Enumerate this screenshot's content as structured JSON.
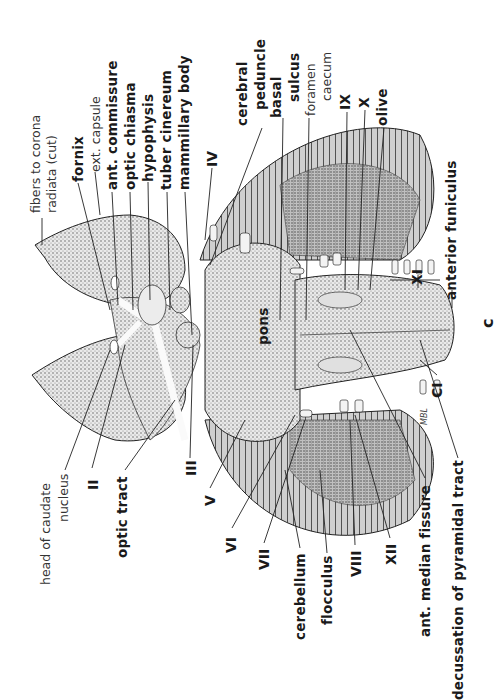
{
  "figure": {
    "panel_letter": "c",
    "signature": "MBL",
    "labels_top": {
      "fibers_corona_1": "fibers to corona",
      "fibers_corona_2": "radiata (cut)",
      "fornix": "fornix",
      "ext_capsule": "ext. capsule",
      "ant_commissure": "ant. commissure",
      "optic_chiasma": "optic chiasma",
      "hypophysis": "hypophysis",
      "tuber_cinereum": "tuber cinereum",
      "mammillary_body": "mammillary body",
      "nerve_iv": "IV",
      "cerebral_peduncle_1": "cerebral",
      "cerebral_peduncle_2": "peduncle",
      "basal_sulcus_1": "basal",
      "basal_sulcus_2": "sulcus",
      "foramen_caecum_1": "foramen",
      "foramen_caecum_2": "caecum",
      "nerve_ix": "IX",
      "nerve_x": "X",
      "olive": "olive",
      "nerve_xi": "XI",
      "anterior_funiculus": "anterior funiculus"
    },
    "labels_bottom": {
      "head_caudate_1": "head of caudate",
      "head_caudate_2": "nucleus",
      "nerve_ii": "II",
      "optic_tract": "optic tract",
      "nerve_iii": "III",
      "nerve_v": "V",
      "nerve_vi": "VI",
      "nerve_vii": "VII",
      "cerebellum": "cerebellum",
      "flocculus": "flocculus",
      "nerve_viii": "VIII",
      "nerve_xii": "XII",
      "ant_median_fissure": "ant. median fissure",
      "decussation": "decussation of pyramidal tract"
    },
    "labels_center": {
      "pons": "pons",
      "nerve_ci": "CI"
    }
  }
}
